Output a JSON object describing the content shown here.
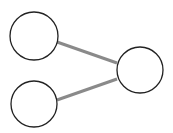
{
  "diagram": {
    "type": "graph",
    "nodes": [
      {
        "id": "node-top-left",
        "cx": 34,
        "cy": 36,
        "r": 24,
        "label": ""
      },
      {
        "id": "node-bottom-left",
        "cx": 34,
        "cy": 104,
        "r": 24,
        "label": ""
      },
      {
        "id": "node-right",
        "cx": 140,
        "cy": 70,
        "r": 24,
        "label": ""
      }
    ],
    "edges": [
      {
        "from": "node-top-left",
        "to": "node-right"
      },
      {
        "from": "node-bottom-left",
        "to": "node-right"
      }
    ],
    "colors": {
      "node_stroke": "#222222",
      "node_fill": "#ffffff",
      "edge": "#8a8a8a"
    }
  }
}
